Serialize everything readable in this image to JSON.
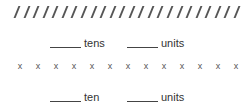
{
  "slash_row": {
    "count": 24,
    "glyph": "/"
  },
  "first_prompt": {
    "blank1": "______",
    "label1": "tens",
    "blank2": "______",
    "label2": "units"
  },
  "x_row": {
    "count": 13,
    "glyph": "x"
  },
  "second_prompt": {
    "blank1": "______",
    "label1": "ten",
    "blank2": "______",
    "label2": "units"
  }
}
